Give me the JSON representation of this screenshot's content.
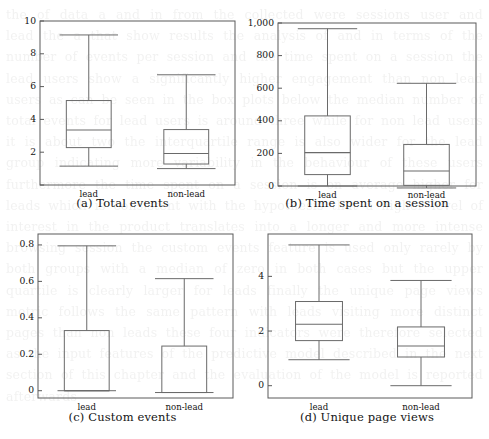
{
  "figure": {
    "background_color": "#ffffff",
    "line_color": "#6a6a6a",
    "text_color": "#141414",
    "ghost_text": "the of data a and in from the collected were sessions user and lead the a that show results the analysis of and in terms of the number of events per session and the time spent on a session the lead users show a significantly higher engagement than non lead users as can be seen in the box plots below the median number of total events for lead users is around three while for non lead users it is about two the interquartile range is also wider for the lead group indicating more variability in the behaviour of these users furthermore the time spent on a session is on average higher for leads which is consistent with the hypothesis that a higher level of interest in the product translates into a longer and more intense browsing session the custom events feature is used only rarely by both groups with a median of zero in both cases but the upper quartile is clearly larger for leads finally the unique page views metric follows the same pattern with leads visiting more distinct pages than non leads these four indicators were therefore selected as the input features of the predictive model described in the next section of this chapter and the evaluation of the model is reported afterwards"
  },
  "panels": [
    {
      "id": "a",
      "caption": "(a) Total events",
      "y_ticks": [
        0,
        2,
        4,
        6,
        8,
        10
      ],
      "y_tick_labels": [
        "",
        "2",
        "4",
        "6",
        "8",
        "10"
      ],
      "ylim": [
        0,
        10
      ],
      "categories": [
        "lead",
        "non-lead"
      ],
      "chart_data": {
        "type": "box",
        "title": "Total events",
        "xlabel": "",
        "ylabel": "",
        "boxes": [
          {
            "label": "lead",
            "whisker_low": 1.15,
            "q1": 2.28,
            "median": 3.35,
            "q3": 5.15,
            "whisker_high": 9.15
          },
          {
            "label": "non-lead",
            "whisker_low": 1.0,
            "q1": 1.28,
            "median": 1.92,
            "q3": 3.38,
            "whisker_high": 6.72
          }
        ]
      }
    },
    {
      "id": "b",
      "caption": "(b) Time spent on a session",
      "y_ticks": [
        0,
        200,
        400,
        600,
        800,
        1000
      ],
      "y_tick_labels": [
        "0",
        "200",
        "400",
        "600",
        "800",
        "1,000"
      ],
      "ylim": [
        0,
        1000
      ],
      "categories": [
        "lead",
        "non-lead"
      ],
      "chart_data": {
        "type": "box",
        "title": "Time spent on a session",
        "xlabel": "",
        "ylabel": "",
        "boxes": [
          {
            "label": "lead",
            "whisker_low": 0,
            "q1": 70,
            "median": 205,
            "q3": 430,
            "whisker_high": 965
          },
          {
            "label": "non-lead",
            "whisker_low": -12,
            "q1": 4,
            "median": 92,
            "q3": 255,
            "whisker_high": 630
          }
        ]
      }
    },
    {
      "id": "c",
      "caption": "(c) Custom events",
      "y_ticks": [
        0,
        0.2,
        0.4,
        0.6,
        0.8
      ],
      "y_tick_labels": [
        "0",
        "0.2",
        "0.4",
        "0.6",
        "0.8"
      ],
      "ylim": [
        -0.04,
        0.86
      ],
      "categories": [
        "lead",
        "non-lead"
      ],
      "chart_data": {
        "type": "box",
        "title": "Custom events",
        "xlabel": "",
        "ylabel": "",
        "boxes": [
          {
            "label": "lead",
            "whisker_low": 0,
            "q1": 0,
            "median": 0,
            "q3": 0.33,
            "whisker_high": 0.795
          },
          {
            "label": "non-lead",
            "whisker_low": -0.01,
            "q1": -0.01,
            "median": -0.01,
            "q3": 0.245,
            "whisker_high": 0.615
          }
        ]
      }
    },
    {
      "id": "d",
      "caption": "(d) Unique page views",
      "y_ticks": [
        0,
        2,
        4
      ],
      "y_tick_labels": [
        "0",
        "2",
        "4"
      ],
      "ylim": [
        -0.45,
        5.55
      ],
      "categories": [
        "lead",
        "non-lead"
      ],
      "chart_data": {
        "type": "box",
        "title": "Unique page views",
        "xlabel": "",
        "ylabel": "",
        "boxes": [
          {
            "label": "lead",
            "whisker_low": 0.95,
            "q1": 1.65,
            "median": 2.25,
            "q3": 3.08,
            "whisker_high": 5.15
          },
          {
            "label": "non-lead",
            "whisker_low": 0.0,
            "q1": 1.05,
            "median": 1.45,
            "q3": 2.15,
            "whisker_high": 3.85
          }
        ]
      }
    }
  ]
}
